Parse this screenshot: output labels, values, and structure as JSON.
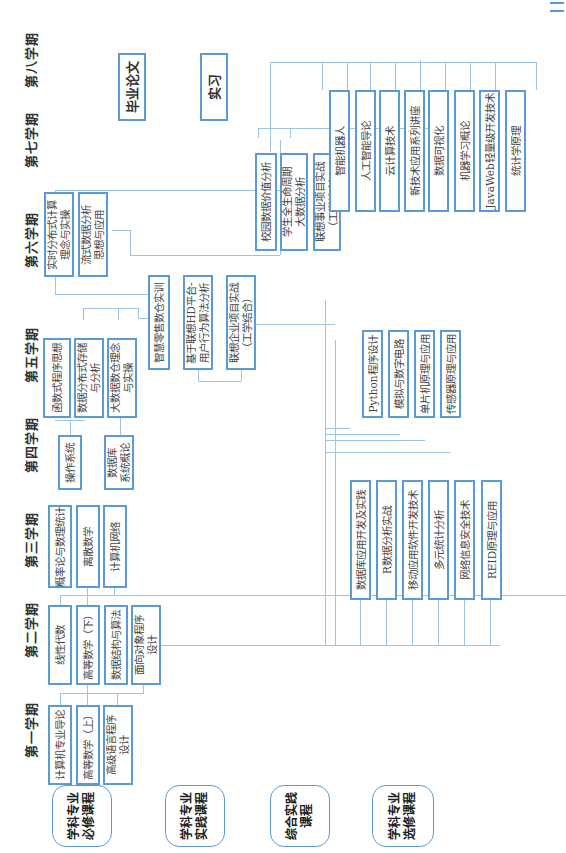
{
  "semesters": [
    "第一学期",
    "第二学期",
    "第三学期",
    "第四学期",
    "第五学期",
    "第六学期",
    "第七学期",
    "第八学期"
  ],
  "categories": [
    "学科专业\n必修课程",
    "学科专业\n实践课程",
    "综合实践\n课程",
    "学科专业\n选修课程"
  ],
  "required": {
    "sem1": [
      "计算机专业导论",
      "高等数学（上）",
      "高级语言程序\n设计"
    ],
    "sem2": [
      "线性代数",
      "高等数学（下）",
      "数据结构与算法",
      "面向对象程序\n设计"
    ],
    "sem3": [
      "概率论与数理统计",
      "离散数学",
      "计算机网络"
    ],
    "sem4": [
      "操作系统",
      "数据库\n系统概论"
    ],
    "sem5": [
      "函数式程序思想",
      "数据分布式存储\n与分析",
      "大数据数仓理念\n与实操"
    ],
    "sem6": [
      "实时分布式计算\n理念与实操",
      "流式数据分析\n思想与应用"
    ]
  },
  "practice": {
    "sem5": [
      "智慧零售数仓实训",
      "基于联想HD平台-\n用户行为算法分析",
      "联想企业项目实战\n（工学结合）"
    ],
    "sem7": [
      "校园数据价值分析",
      "学生全生命周期\n大数据分析",
      "联想事业项目实战\n（工学结合）"
    ]
  },
  "comprehensive": [
    "毕业论文",
    "实习"
  ],
  "electives": {
    "group_a": [
      "数据库应用开发及实践",
      "R数据分析实战",
      "移动应用软件开发技术",
      "多元统计分析",
      "网络信息安全技术",
      "REID原理与应用"
    ],
    "group_b": [
      "Python程序设计",
      "模拟与数字电路",
      "单片机原理与应用",
      "传感器原理与应用"
    ],
    "group_c": [
      "智能机器人",
      "人工智能导论",
      "云计算技术",
      "新技术应用系列讲座",
      "数据可视化",
      "机器学习概论",
      "JavaWeb轻量级开发技术",
      "统计学原理"
    ]
  }
}
